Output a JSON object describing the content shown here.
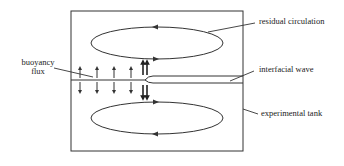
{
  "diagram": {
    "type": "schematic",
    "labels": {
      "residual_circulation": "residual circulation",
      "interfacial_wave": "interfacial wave",
      "buoyancy_flux_line1": "buoyancy",
      "buoyancy_flux_line2": "flux",
      "experimental_tank": "experimental tank"
    },
    "colors": {
      "line": "#333333",
      "background": "#ffffff"
    },
    "elements": {
      "tank": {
        "x": 71,
        "y": 11,
        "width": 172,
        "height": 140
      },
      "upper_circulation": {
        "cx": 157,
        "cy": 43,
        "rx": 66,
        "ry": 16,
        "direction": "counter-clockwise"
      },
      "lower_circulation": {
        "cx": 157,
        "cy": 118,
        "rx": 66,
        "ry": 16,
        "direction": "clockwise"
      },
      "interface_y": 80,
      "small_flux_arrows_x": [
        80,
        97,
        114,
        131
      ],
      "double_flux_arrows_x": [
        143,
        147
      ]
    }
  }
}
